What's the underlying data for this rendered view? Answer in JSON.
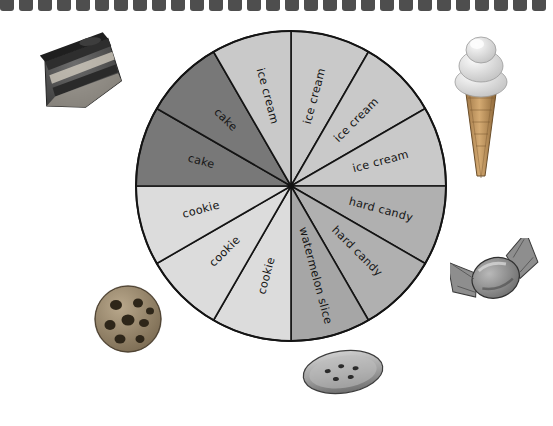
{
  "page": {
    "background_color": "#ffffff",
    "binding": {
      "name": "spiral-notebook-binding",
      "tab_count": 29,
      "color": "#4e4e4e"
    }
  },
  "chart_data": {
    "type": "pie",
    "title": "",
    "subtitle": "",
    "xlabel": "",
    "ylabel": "",
    "legend_position": "none",
    "grid": false,
    "center": {
      "x": 291,
      "y": 186
    },
    "radius": 155,
    "slice_count": 12,
    "slice_angle_degrees": 30,
    "note": "Each slice is an equal 30-degree wedge; labels are repeated per wedge.",
    "categories": [
      "ice cream",
      "hard candy",
      "watermelon slice",
      "cookie",
      "cake"
    ],
    "values": [
      4,
      2,
      1,
      3,
      2
    ],
    "category_colors": {
      "ice cream": "#c9c9c9",
      "hard candy": "#b0b0b0",
      "watermelon slice": "#a6a6a6",
      "cookie": "#dcdcdc",
      "cake": "#787878"
    },
    "slices": [
      {
        "index": 0,
        "label": "ice cream",
        "start_deg": 0,
        "end_deg": 30,
        "color": "#c9c9c9"
      },
      {
        "index": 1,
        "label": "ice cream",
        "start_deg": 30,
        "end_deg": 60,
        "color": "#c9c9c9"
      },
      {
        "index": 2,
        "label": "ice cream",
        "start_deg": 60,
        "end_deg": 90,
        "color": "#c9c9c9"
      },
      {
        "index": 3,
        "label": "hard candy",
        "start_deg": 90,
        "end_deg": 120,
        "color": "#b0b0b0"
      },
      {
        "index": 4,
        "label": "hard candy",
        "start_deg": 120,
        "end_deg": 150,
        "color": "#b0b0b0"
      },
      {
        "index": 5,
        "label": "watermelon slice",
        "start_deg": 150,
        "end_deg": 180,
        "color": "#a6a6a6"
      },
      {
        "index": 6,
        "label": "cookie",
        "start_deg": 180,
        "end_deg": 210,
        "color": "#dcdcdc"
      },
      {
        "index": 7,
        "label": "cookie",
        "start_deg": 210,
        "end_deg": 240,
        "color": "#dcdcdc"
      },
      {
        "index": 8,
        "label": "cookie",
        "start_deg": 240,
        "end_deg": 270,
        "color": "#dcdcdc"
      },
      {
        "index": 9,
        "label": "cake",
        "start_deg": 270,
        "end_deg": 300,
        "color": "#787878"
      },
      {
        "index": 10,
        "label": "cake",
        "start_deg": 300,
        "end_deg": 330,
        "color": "#787878"
      },
      {
        "index": 11,
        "label": "ice cream",
        "start_deg": 330,
        "end_deg": 360,
        "color": "#c9c9c9"
      }
    ]
  },
  "photos": [
    {
      "name": "cake-photo",
      "caption": "cake"
    },
    {
      "name": "ice-cream-photo",
      "caption": "ice cream"
    },
    {
      "name": "hard-candy-photo",
      "caption": "hard candy"
    },
    {
      "name": "cookie-photo",
      "caption": "cookie"
    },
    {
      "name": "watermelon-photo",
      "caption": "watermelon slice"
    }
  ]
}
